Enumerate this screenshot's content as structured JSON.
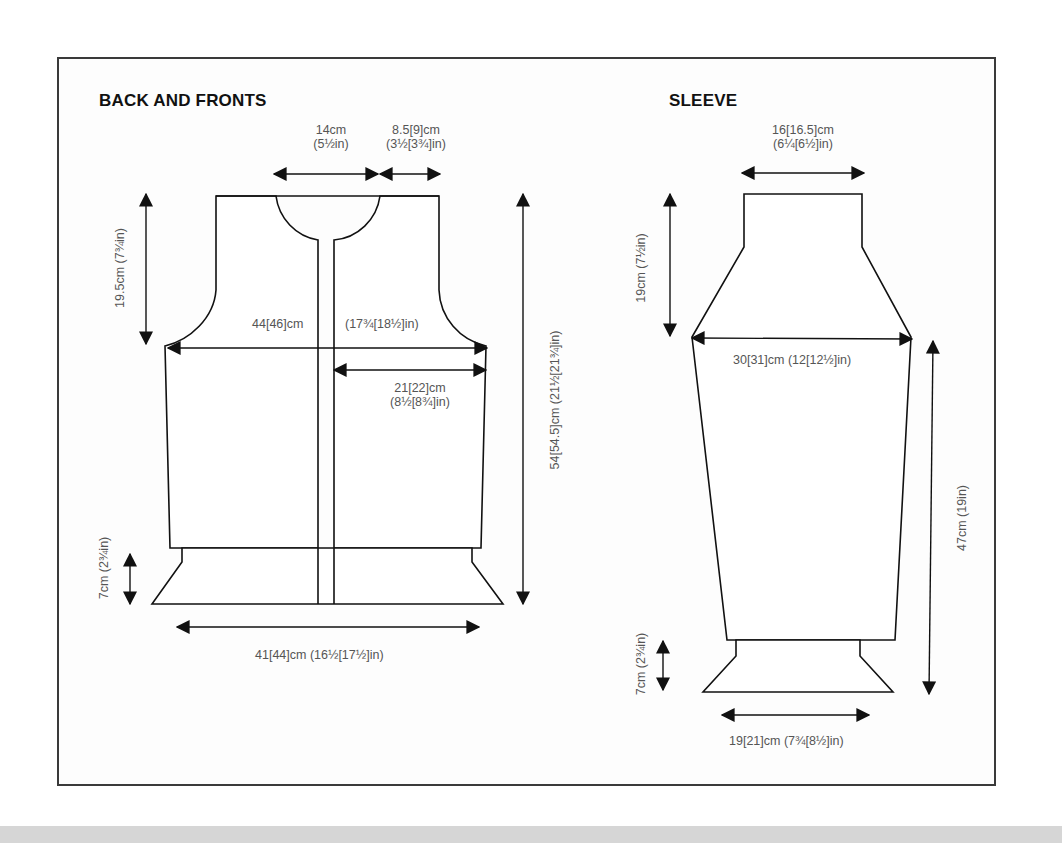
{
  "sections": {
    "back_and_fronts": {
      "title": "BACK AND FRONTS",
      "neck_width": {
        "cm": "14cm",
        "in": "(5½in)"
      },
      "shoulder_width": {
        "cm": "8.5[9]cm",
        "in": "(3½[3¾]in)"
      },
      "armhole_depth": "19.5cm (7¾in)",
      "chest_width_cm": "44[46]cm",
      "chest_width_in": "(17¾[18½]in)",
      "front_width": {
        "cm": "21[22]cm",
        "in": "(8½[8¾]in)"
      },
      "total_length": "54[54.5]cm (21½[21¾]in)",
      "rib_depth": "7cm (2¾in)",
      "hem_width": "41[44]cm (16½[17½]in)"
    },
    "sleeve": {
      "title": "SLEEVE",
      "top_width": {
        "cm": "16[16.5]cm",
        "in": "(6¼[6½]in)"
      },
      "cap_depth": "19cm (7½in)",
      "upper_width": "30[31]cm (12[12½]in)",
      "length": "47cm (19in)",
      "cuff_depth": "7cm (2¾in)",
      "cuff_width": "19[21]cm (7¾[8½]in)"
    }
  },
  "colors": {
    "line": "#111111",
    "label": "#555555",
    "frame": "#3a3a3a",
    "band": "#d6d6d6"
  }
}
